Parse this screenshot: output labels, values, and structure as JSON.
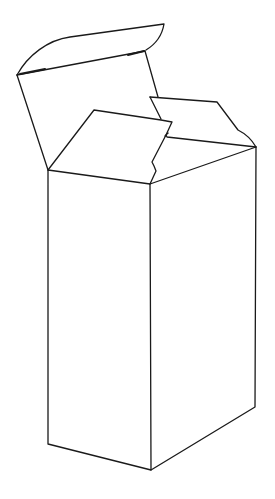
{
  "diagram": {
    "background_color": "#ffffff",
    "stroke_color": "#1a1a1a",
    "parts": [
      {
        "name": "top-back-flap",
        "description": "back lid flap folded open backward"
      },
      {
        "name": "back-panel",
        "description": "inner back wall of box"
      },
      {
        "name": "right-flap",
        "description": "right side dust flap, open"
      },
      {
        "name": "front-left-flap",
        "description": "front dust flap, partially folded"
      },
      {
        "name": "front-left-face",
        "description": "left visible face of box"
      },
      {
        "name": "front-right-face",
        "description": "right visible face of box"
      }
    ]
  }
}
